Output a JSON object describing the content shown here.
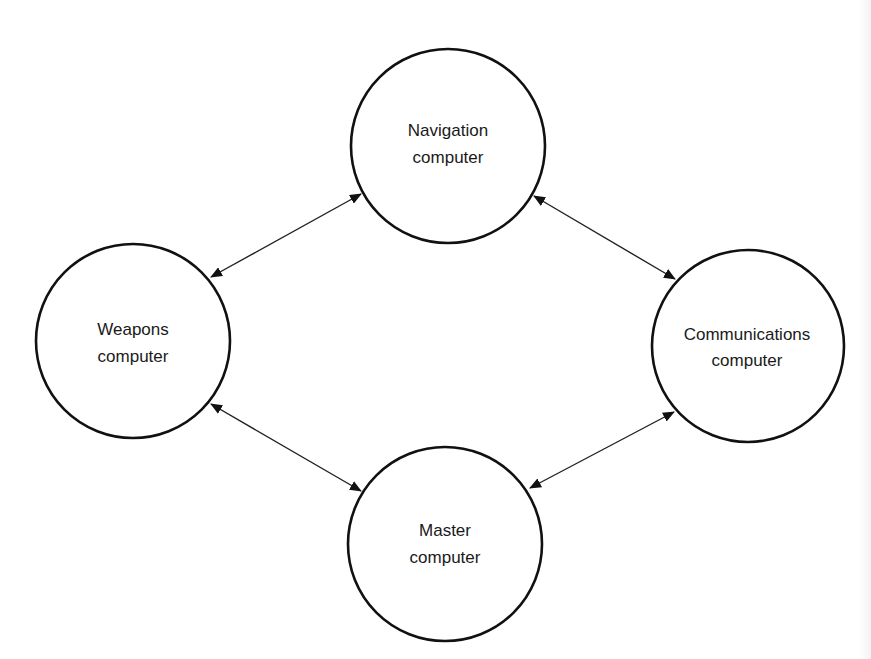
{
  "diagram": {
    "type": "network",
    "stroke_color": "#111111",
    "nodes": [
      {
        "id": "navigation",
        "line1": "Navigation",
        "line2": "computer",
        "cx": 448,
        "cy": 146,
        "r": 97
      },
      {
        "id": "weapons",
        "line1": "Weapons",
        "line2": "computer",
        "cx": 133,
        "cy": 341,
        "r": 97
      },
      {
        "id": "communications",
        "line1": "Communications",
        "line2": "computer",
        "cx": 748,
        "cy": 346,
        "r": 96
      },
      {
        "id": "master",
        "line1": "Master",
        "line2": "computer",
        "cx": 445,
        "cy": 544,
        "r": 97
      }
    ],
    "edges": [
      {
        "from": "navigation",
        "to": "weapons",
        "bidirectional": true
      },
      {
        "from": "navigation",
        "to": "communications",
        "bidirectional": true
      },
      {
        "from": "weapons",
        "to": "master",
        "bidirectional": true
      },
      {
        "from": "communications",
        "to": "master",
        "bidirectional": true
      }
    ]
  }
}
